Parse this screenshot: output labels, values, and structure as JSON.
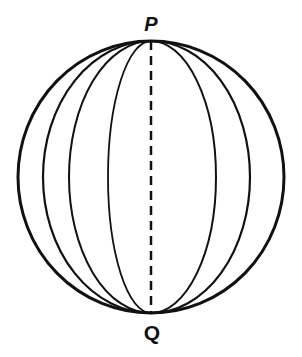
{
  "diagram": {
    "type": "sphere-with-meridians",
    "labels": {
      "top_pole": "P",
      "bottom_pole": "Q"
    },
    "sphere": {
      "cx": 151,
      "cy": 177,
      "rx": 133,
      "ry": 136
    },
    "meridians_left_half_widths": [
      108,
      82,
      43
    ],
    "meridians_right_half_widths": [
      99,
      65
    ],
    "axis": {
      "style": "dashed",
      "from": "P",
      "to": "Q"
    },
    "colors": {
      "stroke": "#111111",
      "background": "#ffffff"
    }
  }
}
